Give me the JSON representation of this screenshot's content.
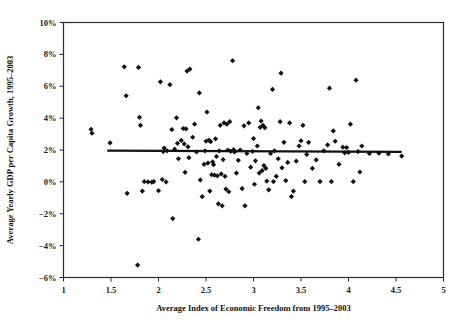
{
  "chart_data": {
    "type": "scatter",
    "title": "",
    "xlabel": "Average Index of Economic Freedom from 1995–2003",
    "ylabel": "Average Yearly GDP per Capita Growth, 1995–2003",
    "xlim": [
      1,
      5
    ],
    "ylim": [
      -6,
      10
    ],
    "xticks": [
      1,
      1.5,
      2,
      2.5,
      3,
      3.5,
      4,
      4.5,
      5
    ],
    "xticklabels": [
      "1",
      "1.5",
      "2",
      "2.5",
      "3",
      "3.5",
      "4",
      "4.5",
      "5"
    ],
    "yticks": [
      -6,
      -4,
      -2,
      0,
      2,
      4,
      6,
      8,
      10
    ],
    "yticklabels": [
      "−6%",
      "−4%",
      "−2%",
      "0%",
      "2%",
      "4%",
      "6%",
      "8%",
      "10%"
    ],
    "grid": false,
    "legend": null,
    "marker": "diamond",
    "marker_color": "#111111",
    "trendline": {
      "label": "linear fit",
      "color": "#111111",
      "x_start": 1.46,
      "y_start": 1.96,
      "x_end": 4.56,
      "y_end": 1.88
    },
    "points": [
      [
        1.29,
        3.3
      ],
      [
        1.3,
        3.05
      ],
      [
        1.49,
        2.45
      ],
      [
        1.64,
        7.22
      ],
      [
        1.66,
        5.4
      ],
      [
        1.67,
        -0.72
      ],
      [
        1.78,
        -5.22
      ],
      [
        1.79,
        7.18
      ],
      [
        1.8,
        4.05
      ],
      [
        1.81,
        3.55
      ],
      [
        1.83,
        -0.58
      ],
      [
        1.85,
        0.02
      ],
      [
        1.89,
        0.0
      ],
      [
        1.93,
        -0.02
      ],
      [
        1.95,
        0.02
      ],
      [
        2.0,
        -0.55
      ],
      [
        2.02,
        6.28
      ],
      [
        2.04,
        0.15
      ],
      [
        2.05,
        1.9
      ],
      [
        2.06,
        2.12
      ],
      [
        2.08,
        0.0
      ],
      [
        2.09,
        1.95
      ],
      [
        2.12,
        6.1
      ],
      [
        2.14,
        3.28
      ],
      [
        2.15,
        -2.3
      ],
      [
        2.17,
        2.05
      ],
      [
        2.19,
        4.02
      ],
      [
        2.2,
        2.42
      ],
      [
        2.21,
        1.45
      ],
      [
        2.24,
        2.6
      ],
      [
        2.26,
        3.35
      ],
      [
        2.27,
        2.38
      ],
      [
        2.28,
        0.6
      ],
      [
        2.29,
        3.32
      ],
      [
        2.3,
        6.95
      ],
      [
        2.31,
        2.2
      ],
      [
        2.32,
        1.52
      ],
      [
        2.33,
        7.08
      ],
      [
        2.36,
        2.8
      ],
      [
        2.38,
        3.62
      ],
      [
        2.4,
        1.88
      ],
      [
        2.42,
        -3.6
      ],
      [
        2.43,
        5.58
      ],
      [
        2.44,
        0.12
      ],
      [
        2.46,
        -0.92
      ],
      [
        2.48,
        1.1
      ],
      [
        2.49,
        1.95
      ],
      [
        2.5,
        2.55
      ],
      [
        2.51,
        4.38
      ],
      [
        2.52,
        1.18
      ],
      [
        2.53,
        2.62
      ],
      [
        2.54,
        -0.58
      ],
      [
        2.55,
        2.52
      ],
      [
        2.56,
        0.45
      ],
      [
        2.57,
        1.25
      ],
      [
        2.58,
        1.08
      ],
      [
        2.59,
        0.42
      ],
      [
        2.6,
        2.7
      ],
      [
        2.61,
        1.6
      ],
      [
        2.62,
        0.38
      ],
      [
        2.63,
        -1.38
      ],
      [
        2.64,
        1.95
      ],
      [
        2.65,
        3.55
      ],
      [
        2.66,
        0.5
      ],
      [
        2.67,
        -1.5
      ],
      [
        2.68,
        1.4
      ],
      [
        2.69,
        3.7
      ],
      [
        2.7,
        0.35
      ],
      [
        2.71,
        -0.45
      ],
      [
        2.72,
        3.62
      ],
      [
        2.73,
        2.0
      ],
      [
        2.74,
        -0.62
      ],
      [
        2.75,
        3.78
      ],
      [
        2.76,
        1.92
      ],
      [
        2.78,
        7.6
      ],
      [
        2.79,
        2.02
      ],
      [
        2.8,
        1.88
      ],
      [
        2.82,
        0.55
      ],
      [
        2.84,
        1.35
      ],
      [
        2.86,
        2.0
      ],
      [
        2.88,
        -0.42
      ],
      [
        2.9,
        3.52
      ],
      [
        2.91,
        -1.5
      ],
      [
        2.93,
        1.78
      ],
      [
        2.95,
        3.7
      ],
      [
        2.97,
        0.92
      ],
      [
        2.99,
        1.92
      ],
      [
        3.0,
        2.72
      ],
      [
        3.01,
        -0.15
      ],
      [
        3.02,
        1.32
      ],
      [
        3.04,
        2.25
      ],
      [
        3.05,
        4.65
      ],
      [
        3.06,
        0.55
      ],
      [
        3.07,
        3.42
      ],
      [
        3.08,
        3.82
      ],
      [
        3.09,
        0.7
      ],
      [
        3.1,
        3.55
      ],
      [
        3.11,
        1.02
      ],
      [
        3.12,
        3.4
      ],
      [
        3.13,
        0.85
      ],
      [
        3.14,
        0.05
      ],
      [
        3.16,
        -0.5
      ],
      [
        3.18,
        1.78
      ],
      [
        3.2,
        5.8
      ],
      [
        3.21,
        0.02
      ],
      [
        3.22,
        1.95
      ],
      [
        3.24,
        0.35
      ],
      [
        3.26,
        1.45
      ],
      [
        3.28,
        3.78
      ],
      [
        3.29,
        6.82
      ],
      [
        3.3,
        0.88
      ],
      [
        3.32,
        2.48
      ],
      [
        3.34,
        0.08
      ],
      [
        3.36,
        1.22
      ],
      [
        3.38,
        3.7
      ],
      [
        3.4,
        -0.92
      ],
      [
        3.42,
        -0.58
      ],
      [
        3.45,
        1.3
      ],
      [
        3.48,
        2.25
      ],
      [
        3.5,
        2.58
      ],
      [
        3.52,
        3.55
      ],
      [
        3.54,
        0.02
      ],
      [
        3.56,
        1.72
      ],
      [
        3.58,
        2.48
      ],
      [
        3.62,
        0.85
      ],
      [
        3.66,
        1.38
      ],
      [
        3.7,
        0.02
      ],
      [
        3.74,
        1.95
      ],
      [
        3.78,
        2.32
      ],
      [
        3.8,
        5.88
      ],
      [
        3.82,
        0.02
      ],
      [
        3.84,
        3.2
      ],
      [
        3.86,
        2.55
      ],
      [
        3.9,
        1.1
      ],
      [
        3.94,
        2.18
      ],
      [
        3.96,
        1.82
      ],
      [
        3.98,
        2.15
      ],
      [
        4.0,
        1.85
      ],
      [
        4.02,
        3.62
      ],
      [
        4.05,
        0.02
      ],
      [
        4.08,
        6.38
      ],
      [
        4.1,
        1.9
      ],
      [
        4.12,
        0.62
      ],
      [
        4.14,
        2.25
      ],
      [
        4.22,
        1.78
      ],
      [
        4.32,
        1.8
      ],
      [
        4.42,
        1.75
      ],
      [
        4.56,
        1.62
      ]
    ]
  }
}
